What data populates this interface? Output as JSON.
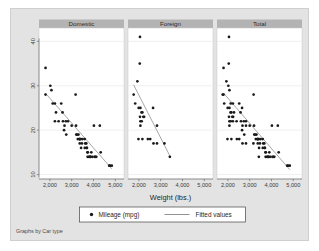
{
  "chart_data": {
    "type": "scatter",
    "title": "",
    "xlabel": "Weight (lbs.)",
    "ylabel": "",
    "note": "Graphs by Car type",
    "xlim": [
      1500,
      5400
    ],
    "ylim": [
      9,
      43
    ],
    "xticks": [
      2000,
      3000,
      4000,
      5000
    ],
    "xticklabels": [
      "2,000",
      "3,000",
      "4,000",
      "5,000"
    ],
    "yticks": [
      10,
      20,
      30,
      40
    ],
    "yticklabels": [
      "10",
      "20",
      "30",
      "40"
    ],
    "grid": "horizontal",
    "legend_position": "bottom",
    "legend": [
      {
        "label": "Mileage (mpg)",
        "marker": "circle",
        "color": "#1a1a1a"
      },
      {
        "label": "Fitted values",
        "marker": "line",
        "color": "#888888"
      }
    ],
    "panel_titles": [
      "Domestic",
      "Foreign",
      "Total"
    ],
    "panels": [
      {
        "name": "Domestic",
        "fit": {
          "x0": 1800,
          "y0": 28.3,
          "x1": 4840,
          "y1": 11.3
        },
        "points": [
          [
            1800,
            34
          ],
          [
            1800,
            28
          ],
          [
            2020,
            30
          ],
          [
            2070,
            29
          ],
          [
            2130,
            26
          ],
          [
            2230,
            26
          ],
          [
            2230,
            22
          ],
          [
            2280,
            24
          ],
          [
            2400,
            22
          ],
          [
            2520,
            26
          ],
          [
            2580,
            24
          ],
          [
            2600,
            22
          ],
          [
            2650,
            20
          ],
          [
            2670,
            21
          ],
          [
            2730,
            22
          ],
          [
            2750,
            19
          ],
          [
            2830,
            22
          ],
          [
            3000,
            21
          ],
          [
            3180,
            28
          ],
          [
            3200,
            21
          ],
          [
            3210,
            19
          ],
          [
            3250,
            19
          ],
          [
            3280,
            18
          ],
          [
            3310,
            19
          ],
          [
            3350,
            18
          ],
          [
            3360,
            18
          ],
          [
            3370,
            17
          ],
          [
            3380,
            18
          ],
          [
            3420,
            18
          ],
          [
            3430,
            16
          ],
          [
            3470,
            17
          ],
          [
            3500,
            18
          ],
          [
            3600,
            18
          ],
          [
            3600,
            16
          ],
          [
            3620,
            17
          ],
          [
            3670,
            17
          ],
          [
            3690,
            16
          ],
          [
            3700,
            16
          ],
          [
            3720,
            15
          ],
          [
            3730,
            14
          ],
          [
            3740,
            15
          ],
          [
            3790,
            14
          ],
          [
            3830,
            14
          ],
          [
            3850,
            14
          ],
          [
            3880,
            14
          ],
          [
            3900,
            15
          ],
          [
            3960,
            14
          ],
          [
            4020,
            21
          ],
          [
            4060,
            14
          ],
          [
            4080,
            14
          ],
          [
            4130,
            14
          ],
          [
            4290,
            21
          ],
          [
            4330,
            15
          ],
          [
            4720,
            12
          ],
          [
            4760,
            12
          ],
          [
            4840,
            12
          ]
        ]
      },
      {
        "name": "Foreign",
        "fit": {
          "x0": 1760,
          "y0": 30.2,
          "x1": 3420,
          "y1": 14.2
        },
        "points": [
          [
            2050,
            41
          ],
          [
            2040,
            35
          ],
          [
            1930,
            31
          ],
          [
            1760,
            28
          ],
          [
            1830,
            26
          ],
          [
            1990,
            25
          ],
          [
            2070,
            25
          ],
          [
            2120,
            24
          ],
          [
            2160,
            24
          ],
          [
            2200,
            23
          ],
          [
            2050,
            23
          ],
          [
            2070,
            22
          ],
          [
            2130,
            22
          ],
          [
            2240,
            23
          ],
          [
            2650,
            25
          ],
          [
            2070,
            21
          ],
          [
            1980,
            18
          ],
          [
            2160,
            18
          ],
          [
            2410,
            18
          ],
          [
            2520,
            18
          ],
          [
            2830,
            21
          ],
          [
            2670,
            17
          ],
          [
            2830,
            17
          ],
          [
            3170,
            17
          ],
          [
            3420,
            14
          ]
        ]
      },
      {
        "name": "Total",
        "fit": {
          "x0": 1790,
          "y0": 28.4,
          "x1": 4840,
          "y1": 11.1
        },
        "points": [
          [
            2050,
            41
          ],
          [
            2040,
            35
          ],
          [
            1800,
            34
          ],
          [
            1930,
            31
          ],
          [
            1760,
            28
          ],
          [
            1800,
            28
          ],
          [
            2020,
            30
          ],
          [
            2070,
            29
          ],
          [
            1830,
            26
          ],
          [
            2130,
            26
          ],
          [
            2230,
            26
          ],
          [
            2280,
            24
          ],
          [
            1990,
            25
          ],
          [
            2070,
            25
          ],
          [
            2120,
            24
          ],
          [
            2160,
            24
          ],
          [
            2200,
            23
          ],
          [
            2050,
            23
          ],
          [
            2070,
            22
          ],
          [
            2130,
            22
          ],
          [
            2240,
            23
          ],
          [
            2230,
            22
          ],
          [
            2400,
            22
          ],
          [
            2520,
            26
          ],
          [
            2580,
            24
          ],
          [
            2600,
            22
          ],
          [
            2650,
            20
          ],
          [
            2650,
            25
          ],
          [
            2670,
            21
          ],
          [
            2730,
            22
          ],
          [
            2750,
            19
          ],
          [
            2830,
            22
          ],
          [
            2830,
            21
          ],
          [
            3000,
            21
          ],
          [
            2070,
            21
          ],
          [
            1980,
            18
          ],
          [
            2160,
            18
          ],
          [
            2410,
            18
          ],
          [
            2520,
            18
          ],
          [
            2670,
            17
          ],
          [
            2830,
            17
          ],
          [
            3170,
            17
          ],
          [
            3180,
            28
          ],
          [
            3200,
            21
          ],
          [
            3210,
            19
          ],
          [
            3250,
            19
          ],
          [
            3280,
            18
          ],
          [
            3310,
            19
          ],
          [
            3350,
            18
          ],
          [
            3360,
            18
          ],
          [
            3370,
            17
          ],
          [
            3380,
            18
          ],
          [
            3420,
            18
          ],
          [
            3420,
            14
          ],
          [
            3430,
            16
          ],
          [
            3470,
            17
          ],
          [
            3500,
            18
          ],
          [
            3600,
            18
          ],
          [
            3600,
            16
          ],
          [
            3620,
            17
          ],
          [
            3670,
            17
          ],
          [
            3690,
            16
          ],
          [
            3700,
            16
          ],
          [
            3720,
            15
          ],
          [
            3730,
            14
          ],
          [
            3740,
            15
          ],
          [
            3790,
            14
          ],
          [
            3830,
            14
          ],
          [
            3850,
            14
          ],
          [
            3880,
            14
          ],
          [
            3900,
            15
          ],
          [
            3960,
            14
          ],
          [
            4020,
            21
          ],
          [
            4060,
            14
          ],
          [
            4080,
            14
          ],
          [
            4130,
            14
          ],
          [
            4290,
            21
          ],
          [
            4330,
            15
          ],
          [
            4720,
            12
          ],
          [
            4760,
            12
          ],
          [
            4840,
            12
          ]
        ]
      }
    ],
    "colors": {
      "canvas_background": "#e3e3e3",
      "plot_background": "#ffffff",
      "panel_header": "#b3b3b3",
      "marker": "#1a1a1a",
      "fit_line": "#8a8a8a",
      "gridline": "#e8e8e8",
      "axis": "#5a5a5a"
    }
  }
}
